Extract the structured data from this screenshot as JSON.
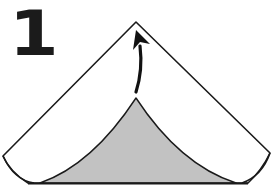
{
  "diagram": {
    "type": "origami-instruction-step",
    "step_number": "1",
    "instruction": "Fold bottom flap up to top point",
    "colors": {
      "paper_front": "#ffffff",
      "paper_back": "#c2c2c2",
      "outline": "#1a1a1a",
      "arrow": "#111111"
    },
    "elements": [
      {
        "id": "paper-triangle",
        "label": "folded paper (white side)"
      },
      {
        "id": "flap",
        "label": "bottom flap (gray side)"
      },
      {
        "id": "fold-arrow",
        "label": "arrow curving up toward top point"
      }
    ]
  }
}
